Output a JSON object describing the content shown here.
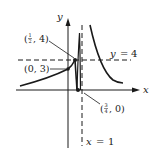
{
  "figure": {
    "axes": {
      "x_label": "x",
      "y_label": "y"
    },
    "asymptotes": {
      "horizontal_label_var": "y",
      "horizontal_label_eq": "=",
      "horizontal_label_val": "4",
      "vertical_label_var": "x",
      "vertical_label_eq": "=",
      "vertical_label_val": "1"
    },
    "points": [
      {
        "label_open": "(",
        "label_frac_num": "1",
        "label_frac_den": "2",
        "label_rest": ", 4)",
        "x": 0.5,
        "y": 4
      },
      {
        "label": "(0, 3)",
        "x": 0,
        "y": 3
      },
      {
        "label_open": "(",
        "label_frac_num": "3",
        "label_frac_den": "4",
        "label_rest": ", 0)",
        "x": 0.75,
        "y": 0
      }
    ],
    "colors": {
      "ink": "#1a1a1a",
      "background": "#ffffff"
    }
  }
}
